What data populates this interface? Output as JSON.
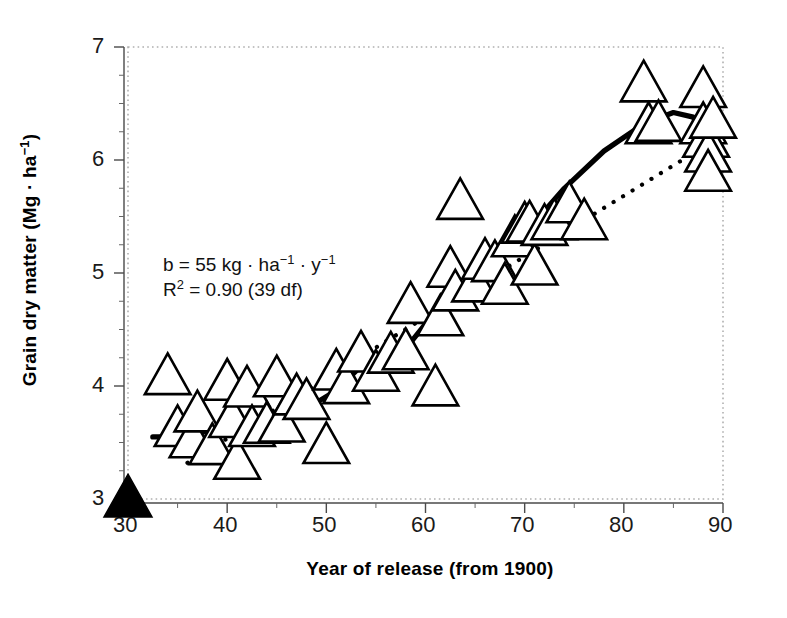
{
  "chart_data": {
    "type": "scatter",
    "title": "",
    "xlabel": "Year of release (from 1900)",
    "ylabel": "Grain dry matter (Mg · ha⁻¹)",
    "xlim": [
      30,
      90
    ],
    "ylim": [
      3,
      7
    ],
    "xticks": [
      30,
      40,
      50,
      60,
      70,
      80,
      90
    ],
    "yticks": [
      3,
      4,
      5,
      6,
      7
    ],
    "xtick_labels": [
      "30",
      "40",
      "50",
      "60",
      "70",
      "80",
      "90"
    ],
    "ytick_labels": [
      "3",
      "4",
      "5",
      "6",
      "7"
    ],
    "xminor_step": 5,
    "yminor_step": 0.25,
    "grid": false,
    "legend": "none",
    "frame_style": "dotted",
    "frame_color": "#b0b0b0",
    "marker": "open-triangle",
    "series": [
      {
        "name": "Cultivars",
        "marker": "open-triangle",
        "points": [
          [
            34,
            4.08
          ],
          [
            35,
            3.62
          ],
          [
            36.5,
            3.52
          ],
          [
            37,
            3.75
          ],
          [
            38.5,
            3.46
          ],
          [
            40,
            4.03
          ],
          [
            40.5,
            3.7
          ],
          [
            41,
            3.33
          ],
          [
            42,
            3.97
          ],
          [
            42.5,
            3.62
          ],
          [
            44,
            3.65
          ],
          [
            45,
            4.06
          ],
          [
            45.5,
            3.66
          ],
          [
            47,
            3.9
          ],
          [
            48,
            3.86
          ],
          [
            50,
            3.47
          ],
          [
            51,
            4.12
          ],
          [
            52,
            4.0
          ],
          [
            53.5,
            4.28
          ],
          [
            55,
            4.11
          ],
          [
            56.5,
            4.27
          ],
          [
            58,
            4.3
          ],
          [
            58.5,
            4.71
          ],
          [
            61,
            3.98
          ],
          [
            61.5,
            4.6
          ],
          [
            62.5,
            5.03
          ],
          [
            63,
            4.82
          ],
          [
            63.5,
            5.63
          ],
          [
            65,
            4.9
          ],
          [
            66,
            5.1
          ],
          [
            67,
            5.08
          ],
          [
            68,
            4.88
          ],
          [
            69,
            5.3
          ],
          [
            70,
            5.42
          ],
          [
            70.5,
            5.43
          ],
          [
            71,
            5.05
          ],
          [
            72,
            5.4
          ],
          [
            73,
            5.45
          ],
          [
            74.5,
            5.6
          ],
          [
            76,
            5.45
          ],
          [
            82,
            6.67
          ],
          [
            82.5,
            6.3
          ],
          [
            83.5,
            6.32
          ],
          [
            88,
            6.62
          ],
          [
            88,
            6.3
          ],
          [
            88.3,
            6.18
          ],
          [
            88.5,
            6.05
          ],
          [
            88.5,
            5.88
          ],
          [
            89,
            6.35
          ]
        ]
      },
      {
        "name": "Reference",
        "marker": "filled-triangle",
        "points": [
          [
            30,
            3.0
          ]
        ]
      }
    ],
    "lines": [
      {
        "name": "regression",
        "style": "dotted",
        "slope_note": "b = 55 kg·ha⁻¹·y⁻¹",
        "points": [
          [
            36,
            3.32
          ],
          [
            90,
            6.22
          ]
        ]
      },
      {
        "name": "trend",
        "style": "solid",
        "points": [
          [
            32.5,
            3.55
          ],
          [
            36,
            3.55
          ],
          [
            40,
            3.66
          ],
          [
            44,
            3.69
          ],
          [
            48,
            3.8
          ],
          [
            51,
            3.96
          ],
          [
            54,
            4.22
          ],
          [
            58,
            4.33
          ],
          [
            60,
            4.55
          ],
          [
            63,
            4.85
          ],
          [
            65,
            5.02
          ],
          [
            67,
            5.18
          ],
          [
            69,
            5.33
          ],
          [
            71,
            5.45
          ],
          [
            74,
            5.75
          ],
          [
            78,
            6.08
          ],
          [
            82,
            6.32
          ],
          [
            85,
            6.42
          ],
          [
            87,
            6.38
          ],
          [
            88.5,
            6.12
          ],
          [
            89.5,
            6.4
          ]
        ]
      }
    ],
    "annotations": [
      {
        "id": "slope",
        "text": "b = 55 kg·ha⁻¹·y⁻¹"
      },
      {
        "id": "r2",
        "text": "R² = 0.90 (39 df)"
      }
    ]
  },
  "annotation": {
    "line1_prefix": "b = 55 kg",
    "line1_mid": " · ha",
    "line1_sup1": "−1",
    "line1_mid2": " · y",
    "line1_sup2": "−1",
    "line2_prefix": "R",
    "line2_sup": "2",
    "line2_rest": " = 0.90 (39 df)"
  },
  "ylabel_parts": {
    "main": "Grain dry matter (Mg · ha",
    "sup": "−1",
    "close": ")"
  },
  "xlabel_text": "Year of release (from 1900)"
}
